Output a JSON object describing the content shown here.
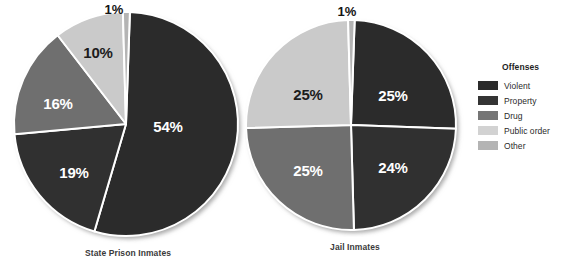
{
  "chart_data": [
    {
      "type": "pie",
      "title": "State Prison Inmates",
      "categories": [
        "Violent",
        "Property",
        "Drug",
        "Public order",
        "Other"
      ],
      "values": [
        54,
        19,
        16,
        10,
        1
      ],
      "labels": [
        "54%",
        "19%",
        "16%",
        "10%",
        "1%"
      ],
      "unit": "percent",
      "legend_position": "right",
      "grid": false
    },
    {
      "type": "pie",
      "title": "Jail Inmates",
      "categories": [
        "Violent",
        "Property",
        "Drug",
        "Public order",
        "Other"
      ],
      "values": [
        25,
        24,
        25,
        25,
        1
      ],
      "labels": [
        "25%",
        "24%",
        "25%",
        "25%",
        "1%"
      ],
      "unit": "percent",
      "legend_position": "right",
      "grid": false
    }
  ],
  "legend": {
    "title": "Offenses",
    "items": [
      {
        "label": "Violent",
        "color": "#2b2b2b"
      },
      {
        "label": "Property",
        "color": "#343434"
      },
      {
        "label": "Drug",
        "color": "#757575"
      },
      {
        "label": "Public order",
        "color": "#d2d2d2"
      },
      {
        "label": "Other",
        "color": "#b4b4b4"
      }
    ]
  },
  "charts": {
    "state": {
      "caption": "State Prison Inmates",
      "slices": [
        {
          "name": "violent",
          "label": "54%",
          "color": "#2b2b2b"
        },
        {
          "name": "property",
          "label": "19%",
          "color": "#303030"
        },
        {
          "name": "drug",
          "label": "16%",
          "color": "#6f6f6f"
        },
        {
          "name": "public-order",
          "label": "10%",
          "color": "#cacaca"
        },
        {
          "name": "other",
          "label": "1%",
          "color": "#b4b4b4"
        }
      ]
    },
    "jail": {
      "caption": "Jail Inmates",
      "slices": [
        {
          "name": "violent",
          "label": "25%",
          "color": "#2b2b2b"
        },
        {
          "name": "property",
          "label": "24%",
          "color": "#303030"
        },
        {
          "name": "drug",
          "label": "25%",
          "color": "#6f6f6f"
        },
        {
          "name": "public-order",
          "label": "25%",
          "color": "#cacaca"
        },
        {
          "name": "other",
          "label": "1%",
          "color": "#b4b4b4"
        }
      ]
    }
  }
}
